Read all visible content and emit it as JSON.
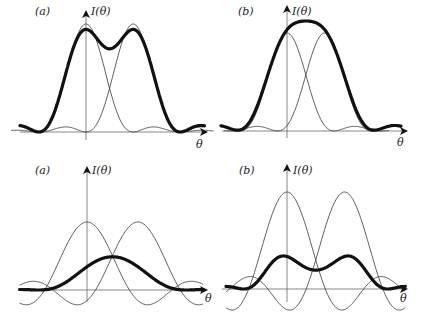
{
  "figure": {
    "panels": [
      {
        "id": "top-a",
        "label": "(a)",
        "ylabel": "I(θ)",
        "xlabel": "θ",
        "description": "Two resolved single-slit diffraction peaks; sum shows a dip (resolved)"
      },
      {
        "id": "top-b",
        "label": "(b)",
        "ylabel": "I(θ)",
        "xlabel": "θ",
        "description": "Two peaks at Rayleigh-limit spacing; sum shows flat top"
      },
      {
        "id": "bottom-a",
        "label": "(a)",
        "ylabel": "I(θ)",
        "xlabel": "θ",
        "description": "Two amplitude curves closer together; thick sum is single peak"
      },
      {
        "id": "bottom-b",
        "label": "(b)",
        "ylabel": "I(θ)",
        "xlabel": "θ",
        "description": "Two amplitude curves; thick sum has flat top"
      }
    ]
  },
  "chart_data": [
    {
      "type": "line",
      "title": "(a)",
      "xlabel": "θ",
      "ylabel": "I(θ)",
      "series": [
        {
          "name": "source 1",
          "kind": "sinc²",
          "center": 0,
          "peak": 1.0
        },
        {
          "name": "source 2",
          "kind": "sinc²",
          "center": 1.0,
          "peak": 1.0
        },
        {
          "name": "sum",
          "kind": "intensity sum",
          "peak": 1.0,
          "dip": 0.73
        }
      ]
    },
    {
      "type": "line",
      "title": "(b)",
      "xlabel": "θ",
      "ylabel": "I(θ)",
      "series": [
        {
          "name": "source 1",
          "kind": "sinc²",
          "center": 0,
          "peak": 1.0
        },
        {
          "name": "source 2",
          "kind": "sinc²",
          "center": 0.8,
          "peak": 1.0
        },
        {
          "name": "sum",
          "kind": "intensity sum",
          "peak": 1.1,
          "shape": "flat top"
        }
      ]
    },
    {
      "type": "line",
      "title": "(a)",
      "xlabel": "θ",
      "ylabel": "I(θ)",
      "series": [
        {
          "name": "source 1",
          "kind": "sinc amplitude",
          "center": 0,
          "peak": 1.0
        },
        {
          "name": "source 2",
          "kind": "sinc amplitude",
          "center": 1.0,
          "peak": 1.0
        },
        {
          "name": "sum",
          "kind": "coherent sum",
          "peak": 1.45
        }
      ]
    },
    {
      "type": "line",
      "title": "(b)",
      "xlabel": "θ",
      "ylabel": "I(θ)",
      "series": [
        {
          "name": "source 1",
          "kind": "sinc amplitude",
          "center": 0,
          "peak": 1.0
        },
        {
          "name": "source 2",
          "kind": "sinc amplitude",
          "center": 1.2,
          "peak": 1.0
        },
        {
          "name": "sum",
          "kind": "sum",
          "peak": 0.88,
          "shape": "flat top"
        }
      ]
    }
  ]
}
